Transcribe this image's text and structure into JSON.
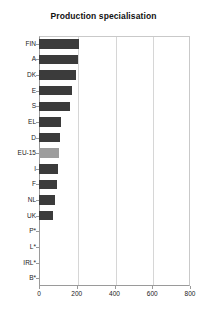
{
  "chart_data": {
    "type": "bar",
    "orientation": "horizontal",
    "title": "Production specialisation",
    "xlabel": "",
    "ylabel": "",
    "xlim": [
      0,
      800
    ],
    "xticks": [
      0,
      200,
      400,
      600,
      800
    ],
    "grid": "vertical",
    "legend": "none",
    "categories": [
      "FIN",
      "A",
      "DK",
      "E",
      "S",
      "EL",
      "D",
      "EU-15",
      "I",
      "F",
      "NL",
      "UK",
      "P*",
      "L*",
      "IRL*",
      "B*"
    ],
    "values": [
      212,
      205,
      196,
      176,
      164,
      116,
      111,
      106,
      100,
      95,
      85,
      76,
      0,
      0,
      0,
      0
    ],
    "highlight_category": "EU-15",
    "colors": {
      "bar": "#3b3b3b",
      "bar_highlight": "#9d9d9d",
      "axis": "#9a9a9a",
      "grid": "#d6d6d6",
      "background": "#ffffff",
      "text": "#222222"
    }
  }
}
